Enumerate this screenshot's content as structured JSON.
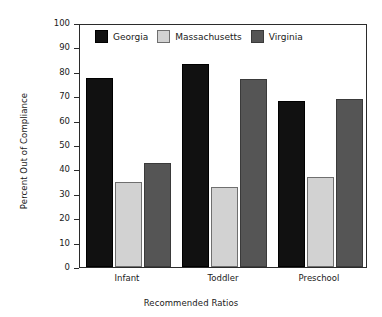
{
  "chart_data": {
    "type": "bar",
    "title": "",
    "xlabel": "Recommended Ratios",
    "ylabel": "Percent Out of Compliance",
    "categories": [
      "Infant",
      "Toddler",
      "Preschool"
    ],
    "series": [
      {
        "name": "Georgia",
        "color": "#111111",
        "values": [
          78,
          84,
          68.5
        ]
      },
      {
        "name": "Massachusetts",
        "color": "#d2d2d2",
        "values": [
          35,
          33,
          37
        ]
      },
      {
        "name": "Virginia",
        "color": "#555555",
        "values": [
          43,
          77.5,
          69.5
        ]
      }
    ],
    "ylim": [
      0,
      100
    ],
    "ytick_step": 10,
    "yticks": [
      "100",
      "90",
      "80",
      "70",
      "60",
      "50",
      "40",
      "30",
      "20",
      "10",
      "0"
    ],
    "grid": false,
    "legend_position": "top-inside"
  },
  "axes": {
    "y_title": "Percent Out of Compliance",
    "x_title": "Recommended Ratios"
  },
  "legend": {
    "items": [
      {
        "label": "Georgia"
      },
      {
        "label": "Massachusetts"
      },
      {
        "label": "Virginia"
      }
    ]
  }
}
